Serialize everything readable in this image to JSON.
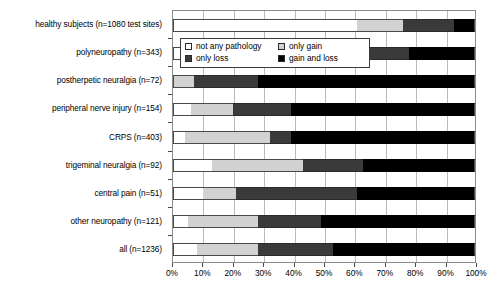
{
  "chart_data": {
    "type": "bar",
    "orientation": "horizontal",
    "stacked": true,
    "title": "",
    "xlabel": "",
    "ylabel": "",
    "xlim": [
      0,
      100
    ],
    "xunit": "%",
    "grid": true,
    "legend_position": "upper-left-inside",
    "tick_labels": [
      "0%",
      "10%",
      "20%",
      "30%",
      "40%",
      "50%",
      "60%",
      "70%",
      "80%",
      "90%",
      "100%"
    ],
    "tick_values": [
      0,
      10,
      20,
      30,
      40,
      50,
      60,
      70,
      80,
      90,
      100
    ],
    "categories": [
      "healthy subjects (n=1080 test sites)",
      "polyneuropathy (n=343)",
      "postherpetic neuralgia (n=72)",
      "peripheral nerve injury (n=154)",
      "CRPS (n=403)",
      "trigeminal neuralgia (n=92)",
      "central pain (n=51)",
      "other neuropathy (n=121)",
      "all (n=1236)"
    ],
    "series": [
      {
        "name": "not any pathology",
        "color": "#ffffff",
        "values": [
          61,
          17,
          0,
          6,
          4,
          13,
          10,
          5,
          8
        ]
      },
      {
        "name": "only gain",
        "color": "#d2d2d2",
        "values": [
          15,
          11,
          7,
          14,
          28,
          30,
          11,
          23,
          20
        ]
      },
      {
        "name": "only loss",
        "color": "#3a3a3a",
        "values": [
          17,
          50,
          21,
          19,
          7,
          20,
          40,
          21,
          25
        ]
      },
      {
        "name": "gain and loss",
        "color": "#000000",
        "values": [
          7,
          22,
          72,
          61,
          61,
          37,
          39,
          51,
          47
        ]
      }
    ]
  },
  "legend": {
    "items": [
      {
        "label": "not any pathology",
        "swatch": "sw-none"
      },
      {
        "label": "only gain",
        "swatch": "sw-gain"
      },
      {
        "label": "only loss",
        "swatch": "sw-loss"
      },
      {
        "label": "gain and loss",
        "swatch": "sw-both"
      }
    ]
  }
}
